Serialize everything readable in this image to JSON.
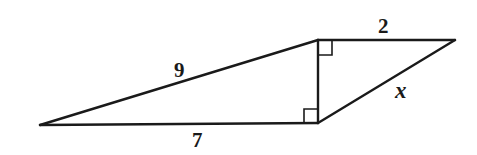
{
  "diagram": {
    "type": "geometry-figure",
    "stroke_color": "#1a1a1a",
    "background": "#ffffff",
    "vertices": {
      "A": {
        "x": 40,
        "y": 125
      },
      "B": {
        "x": 318,
        "y": 123
      },
      "C": {
        "x": 318,
        "y": 40
      },
      "D": {
        "x": 455,
        "y": 40
      }
    },
    "segments": [
      {
        "from": "A",
        "to": "C",
        "label": "9"
      },
      {
        "from": "A",
        "to": "B",
        "label": "7"
      },
      {
        "from": "C",
        "to": "D",
        "label": "2"
      },
      {
        "from": "B",
        "to": "D",
        "label": "x"
      },
      {
        "from": "B",
        "to": "C",
        "label": ""
      }
    ],
    "right_angles": [
      "C",
      "B"
    ],
    "labels": {
      "hypotenuse_left": "9",
      "base_left": "7",
      "top_right": "2",
      "hypotenuse_right": "x"
    }
  }
}
